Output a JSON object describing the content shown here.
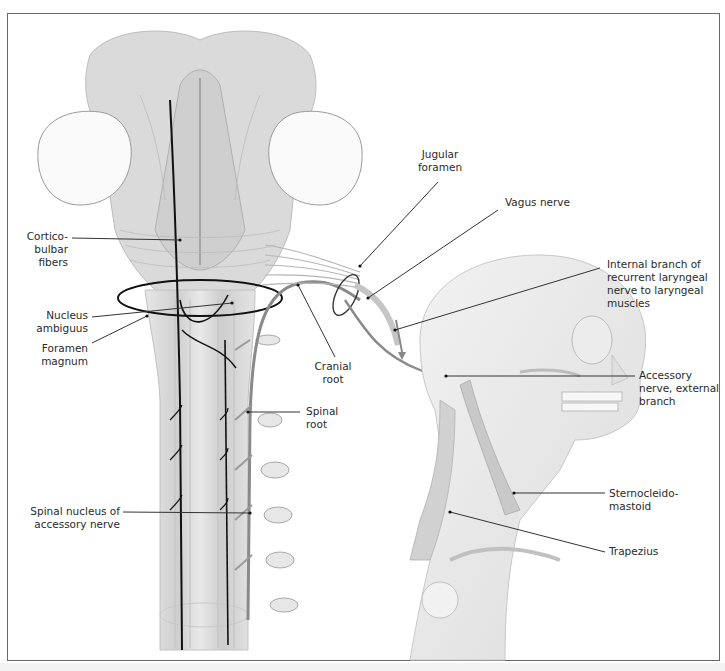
{
  "figure": {
    "colors": {
      "frame": "#6a6a6a",
      "nerve_dark": "#111111",
      "nerve_gray": "#8a8a8a",
      "tissue": "#d9d9d9",
      "leader_line": "#333333",
      "text": "#2a2a2a"
    },
    "labels": {
      "corticobulbar": "Cortico-\nbulbar\nfibers",
      "nucleus_ambiguus": "Nucleus\nambiguus",
      "foramen_magnum": "Foramen\nmagnum",
      "spinal_nucleus": "Spinal nucleus of\naccessory nerve",
      "jugular_foramen": "Jugular\nforamen",
      "vagus_nerve": "Vagus nerve",
      "internal_branch": "Internal branch of\nrecurrent laryngeal\nnerve to laryngeal\nmuscles",
      "cranial_root": "Cranial\nroot",
      "spinal_root": "Spinal\nroot",
      "accessory_external": "Accessory\nnerve, external\nbranch",
      "sternocleidomastoid": "Sternocleido-\nmastoid",
      "trapezius": "Trapezius"
    }
  }
}
